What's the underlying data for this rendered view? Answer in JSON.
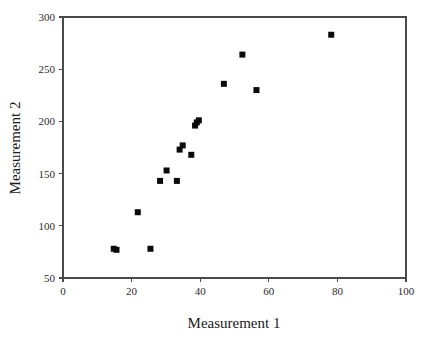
{
  "chart_data": {
    "type": "scatter",
    "title": "",
    "xlabel": "Measurement 1",
    "ylabel": "Measurement 2",
    "xlim": [
      0,
      100
    ],
    "ylim": [
      50,
      300
    ],
    "xticks": [
      0,
      20,
      40,
      60,
      80,
      100
    ],
    "yticks": [
      50,
      100,
      150,
      200,
      250,
      300
    ],
    "xtick_labels": [
      "0",
      "20",
      "40",
      "60",
      "80",
      "100"
    ],
    "ytick_labels": [
      "50",
      "100",
      "150",
      "200",
      "250",
      "300"
    ],
    "grid": false,
    "legend": false,
    "marker": "square",
    "marker_color": "#0a0a0a",
    "marker_size": 6,
    "points": [
      {
        "x": 14.8,
        "y": 78
      },
      {
        "x": 15.6,
        "y": 77
      },
      {
        "x": 25.5,
        "y": 78
      },
      {
        "x": 21.8,
        "y": 113
      },
      {
        "x": 28.3,
        "y": 143
      },
      {
        "x": 33.2,
        "y": 143
      },
      {
        "x": 30.2,
        "y": 153
      },
      {
        "x": 34.0,
        "y": 173
      },
      {
        "x": 34.9,
        "y": 177
      },
      {
        "x": 37.4,
        "y": 168
      },
      {
        "x": 38.5,
        "y": 196
      },
      {
        "x": 39.0,
        "y": 199
      },
      {
        "x": 39.6,
        "y": 201
      },
      {
        "x": 46.9,
        "y": 236
      },
      {
        "x": 52.3,
        "y": 264
      },
      {
        "x": 56.4,
        "y": 230
      },
      {
        "x": 78.2,
        "y": 283
      }
    ]
  }
}
